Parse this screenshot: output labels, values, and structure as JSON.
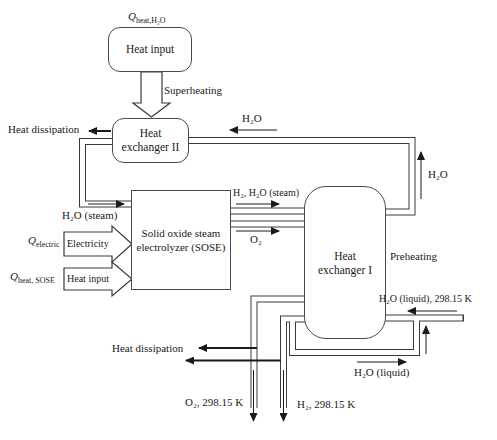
{
  "diagram": {
    "boxes": {
      "heat_input": "Heat input",
      "hx2_line1": "Heat",
      "hx2_line2": "exchanger II",
      "sose_line1": "Solid oxide steam",
      "sose_line2": "electrolyzer (SOSE)",
      "hx1_line1": "Heat",
      "hx1_line2": "exchanger I"
    },
    "inputs": {
      "q_heat_h2o": {
        "q": "Q",
        "sub": "heat,H₂O"
      },
      "q_electric": {
        "q": "Q",
        "sub": "electric"
      },
      "q_heat_sose": {
        "q": "Q",
        "sub": "heat, SOSE"
      },
      "electricity": "Electricity",
      "heat_input": "Heat input"
    },
    "labels": {
      "superheating": "Superheating",
      "heat_dissipation_top": "Heat dissipation",
      "heat_dissipation_bottom": "Heat dissipation",
      "h2o_top": "H₂O",
      "h2o_right": "H₂O",
      "h2o_steam": "H₂O (steam)",
      "h2_h2o_steam": "H₂, H₂O (steam)",
      "o2": "O₂",
      "preheating": "Preheating",
      "h2o_liquid_in": "H₂O (liquid), 298.15 K",
      "h2o_liquid": "H₂O (liquid)",
      "o2_out": "O₂, 298.15 K",
      "h2_out": "H₂, 298.15 K"
    },
    "colors": {
      "line": "#3a3a3a",
      "background": "#ffffff"
    }
  }
}
